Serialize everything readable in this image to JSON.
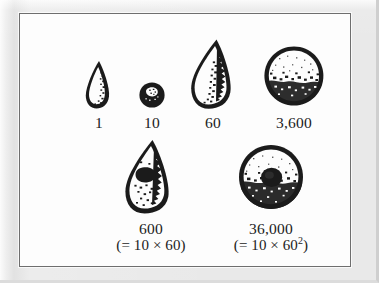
{
  "figure": {
    "kind": "scanned-book-figure",
    "caption_present": false,
    "background_color": "#e9e9e9",
    "plate_color": "#fdfdfd",
    "ink_color": "#1b1b1b",
    "frame_color": "#6e6e6e"
  },
  "tokens": [
    {
      "id": "token-1",
      "shape": "small-cone",
      "shape_icon": "clay-cone-small-icon",
      "value_label": "1",
      "expression_label": "",
      "row": 1
    },
    {
      "id": "token-10",
      "shape": "small-sphere",
      "shape_icon": "clay-sphere-small-icon",
      "value_label": "10",
      "expression_label": "",
      "row": 1
    },
    {
      "id": "token-60",
      "shape": "large-cone",
      "shape_icon": "clay-cone-large-icon",
      "value_label": "60",
      "expression_label": "",
      "row": 1
    },
    {
      "id": "token-3600",
      "shape": "large-sphere",
      "shape_icon": "clay-sphere-large-icon",
      "value_label": "3,600",
      "expression_label": "",
      "row": 1
    },
    {
      "id": "token-600",
      "shape": "large-cone-with-impressed-circle",
      "shape_icon": "clay-cone-perforated-icon",
      "value_label": "600",
      "expression_label": "(= 10 × 60)",
      "row": 2
    },
    {
      "id": "token-36000",
      "shape": "large-sphere-with-impressed-circle",
      "shape_icon": "clay-sphere-perforated-icon",
      "value_label": "36,000",
      "expression_label_prefix": "(= 10 × 60",
      "expression_label_exponent": "2",
      "expression_label_suffix": ")",
      "expression_label": "(= 10 × 60²)",
      "row": 2
    }
  ]
}
